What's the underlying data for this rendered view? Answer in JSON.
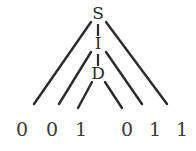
{
  "figure": {
    "kind": "parse-tree-diagram",
    "background_color": "#ffffff",
    "stroke_color": "#2b2b2b",
    "text_color": "#2b2b2b",
    "leaf_text_color": "#3a3a3a"
  },
  "nodes": {
    "root": {
      "label": "S",
      "x": 98,
      "y": 14
    },
    "middle": {
      "label": "I",
      "x": 98,
      "y": 44
    },
    "bottom": {
      "label": "D",
      "x": 98,
      "y": 74
    }
  },
  "leaves": [
    {
      "label": "0",
      "x": 22,
      "y": 130
    },
    {
      "label": "0",
      "x": 52,
      "y": 130
    },
    {
      "label": "1",
      "x": 81,
      "y": 130
    },
    {
      "label": "0",
      "x": 127,
      "y": 130
    },
    {
      "label": "1",
      "x": 155,
      "y": 130
    },
    {
      "label": "1",
      "x": 182,
      "y": 130
    }
  ],
  "edges": {
    "spine": [
      {
        "name": "s-to-i",
        "x1": 98,
        "y1": 24,
        "x2": 98,
        "y2": 36
      },
      {
        "name": "i-to-d",
        "x1": 98,
        "y1": 54,
        "x2": 98,
        "y2": 66
      }
    ],
    "diagonals": [
      {
        "name": "s-left",
        "x1": 91,
        "y1": 22,
        "x2": 34,
        "y2": 104
      },
      {
        "name": "s-right",
        "x1": 106,
        "y1": 22,
        "x2": 167,
        "y2": 104
      },
      {
        "name": "i-left",
        "x1": 91,
        "y1": 52,
        "x2": 59,
        "y2": 104
      },
      {
        "name": "i-right",
        "x1": 106,
        "y1": 52,
        "x2": 142,
        "y2": 104
      },
      {
        "name": "d-left",
        "x1": 92,
        "y1": 82,
        "x2": 78,
        "y2": 108
      },
      {
        "name": "d-right",
        "x1": 105,
        "y1": 82,
        "x2": 122,
        "y2": 108
      }
    ]
  },
  "derivation": {
    "terminal_string": "0 0 1 0 1 1",
    "left_terminals": "0 0 1",
    "right_terminals": "0 1 1"
  }
}
